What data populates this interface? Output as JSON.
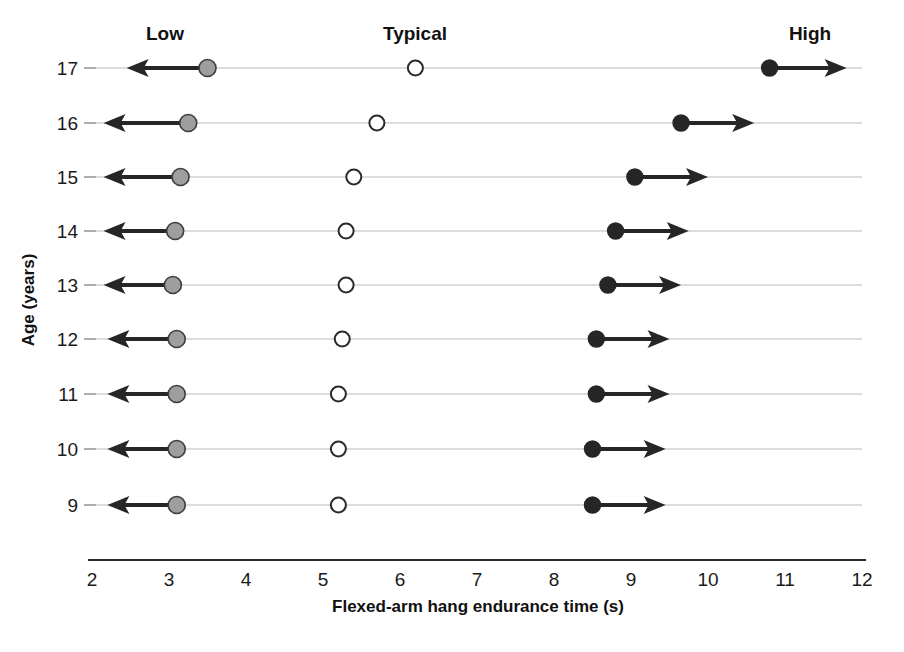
{
  "chart_data": {
    "type": "scatter",
    "title": "",
    "xlabel": "Flexed-arm hang endurance time (s)",
    "ylabel": "Age (years)",
    "xlim": [
      2,
      12
    ],
    "xticks": [
      2,
      3,
      4,
      5,
      6,
      7,
      8,
      9,
      10,
      11,
      12
    ],
    "xtick_labels": [
      "2",
      "3",
      "4",
      "5",
      "6",
      "7",
      "8",
      "9",
      "10",
      "11",
      "12"
    ],
    "categories": [
      "17",
      "16",
      "15",
      "14",
      "13",
      "12",
      "11",
      "10",
      "9"
    ],
    "ytick_labels": [
      "17",
      "16",
      "15",
      "14",
      "13",
      "12",
      "11",
      "10",
      "9"
    ],
    "grid": true,
    "legend_position": "top",
    "column_headers": [
      "Low",
      "Typical",
      "High"
    ],
    "series": [
      {
        "name": "Low",
        "marker": "filled-gray-circle",
        "color": "#9e9e9e",
        "arrow_direction": "left",
        "values": [
          3.5,
          3.25,
          3.15,
          3.08,
          3.05,
          3.1,
          3.1,
          3.1,
          3.1
        ]
      },
      {
        "name": "Typical",
        "marker": "open-circle",
        "color": "#ffffff",
        "arrow_direction": "none",
        "values": [
          6.2,
          5.7,
          5.4,
          5.3,
          5.3,
          5.25,
          5.2,
          5.2,
          5.2
        ]
      },
      {
        "name": "High",
        "marker": "filled-black-circle",
        "color": "#262626",
        "arrow_direction": "right",
        "values": [
          10.8,
          9.65,
          9.05,
          8.8,
          8.7,
          8.55,
          8.55,
          8.5,
          8.5
        ]
      }
    ],
    "arrow_extents": {
      "low_tip": [
        2.45,
        2.15,
        2.15,
        2.15,
        2.15,
        2.2,
        2.2,
        2.2,
        2.2
      ],
      "high_tip": [
        11.8,
        10.6,
        10.0,
        9.75,
        9.65,
        9.5,
        9.5,
        9.45,
        9.45
      ]
    }
  },
  "axis": {
    "x_title": "Flexed-arm hang endurance time (s)",
    "y_title": "Age (years)"
  }
}
